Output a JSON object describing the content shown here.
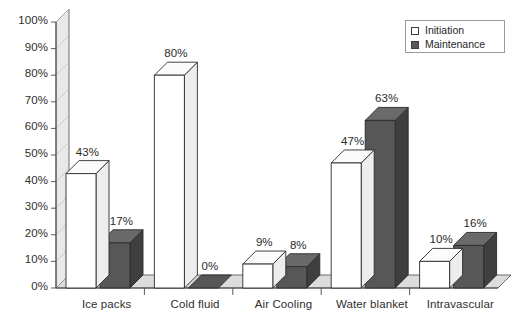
{
  "chart_data": {
    "type": "bar",
    "title": "",
    "xlabel": "",
    "ylabel": "",
    "ylim": [
      0,
      100
    ],
    "yunit": "%",
    "grid": false,
    "legend_position": "top-right",
    "style": "3d-grouped-bar",
    "categories": [
      "Ice packs",
      "Cold fluid",
      "Air Cooling",
      "Water blanket",
      "Intravascular"
    ],
    "series": [
      {
        "name": "Initiation",
        "color": "#ffffff",
        "values": [
          43,
          80,
          9,
          47,
          10
        ],
        "labels": [
          "43%",
          "80%",
          "9%",
          "47%",
          "10%"
        ]
      },
      {
        "name": "Maintenance",
        "color": "#575757",
        "values": [
          17,
          0,
          8,
          63,
          16
        ],
        "labels": [
          "17%",
          "0%",
          "8%",
          "63%",
          "16%"
        ]
      }
    ],
    "yticks": [
      0,
      10,
      20,
      30,
      40,
      50,
      60,
      70,
      80,
      90,
      100
    ],
    "ytick_labels": [
      "0%",
      "10%",
      "20%",
      "30%",
      "40%",
      "50%",
      "60%",
      "70%",
      "80%",
      "90%",
      "100%"
    ]
  },
  "legend": {
    "items": [
      {
        "label": "Initiation",
        "swatch": "white-square-icon"
      },
      {
        "label": "Maintenance",
        "swatch": "dark-square-icon"
      }
    ]
  },
  "colors": {
    "initiation_fill": "#ffffff",
    "maintenance_fill": "#575757",
    "maintenance_side": "#3f3f3f",
    "maintenance_top": "#6a6a6a",
    "outline": "#2b2b2b",
    "axis": "#4a4a4a",
    "wall_fill": "#e9e9e9",
    "floor_fill": "#dcdcdc",
    "background": "#ffffff"
  }
}
